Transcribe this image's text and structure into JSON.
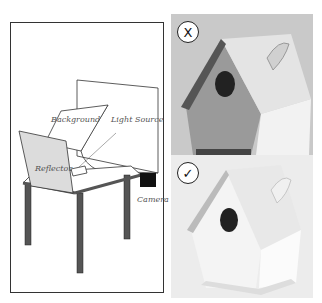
{
  "diagram": {
    "labels": {
      "background": "Background",
      "light_source": "Light Source",
      "reflector": "Reflector",
      "camera": "Camera"
    }
  },
  "photos": [
    {
      "badge": "X",
      "badge_meaning": "incorrect",
      "subject": "birdhouse with butterfly"
    },
    {
      "badge": "✓",
      "badge_meaning": "correct",
      "subject": "birdhouse with butterfly"
    }
  ],
  "colors": {
    "border": "#333333",
    "reflector_fill": "#dcdcdc",
    "table_leg": "#555555",
    "photo_bg_top": "#c8c8c8",
    "photo_bg_bottom": "#ececec"
  }
}
